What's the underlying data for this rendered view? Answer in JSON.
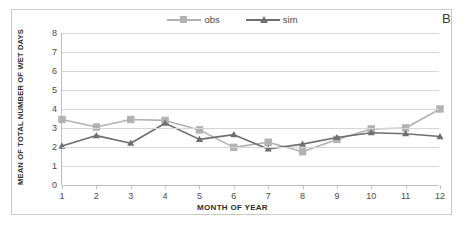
{
  "panel": {
    "letter": "B"
  },
  "legend": {
    "position": "top-center",
    "items": [
      {
        "label": "obs",
        "color": "#b2b2b2",
        "marker": "square"
      },
      {
        "label": "sim",
        "color": "#6f6f6f",
        "marker": "triangle"
      }
    ]
  },
  "chart_data": {
    "type": "line",
    "title": "",
    "xlabel": "MONTH OF YEAR",
    "ylabel": "MEAN OF TOTAL NUMBER OF WET DAYS",
    "categories": [
      "1",
      "2",
      "3",
      "4",
      "5",
      "6",
      "7",
      "8",
      "9",
      "10",
      "11",
      "12"
    ],
    "x": [
      1,
      2,
      3,
      4,
      5,
      6,
      7,
      8,
      9,
      10,
      11,
      12
    ],
    "xlim": [
      1,
      12
    ],
    "ylim": [
      0,
      8
    ],
    "yticks": [
      0,
      1,
      2,
      3,
      4,
      5,
      6,
      7,
      8
    ],
    "grid": true,
    "series": [
      {
        "name": "obs",
        "color": "#b2b2b2",
        "marker": "square",
        "values": [
          3.45,
          3.05,
          3.45,
          3.4,
          2.9,
          1.98,
          2.25,
          1.75,
          2.4,
          2.95,
          3.0,
          4.0
        ]
      },
      {
        "name": "sim",
        "color": "#6f6f6f",
        "marker": "triangle",
        "values": [
          2.05,
          2.6,
          2.2,
          3.25,
          2.4,
          2.65,
          1.9,
          2.15,
          2.5,
          2.75,
          2.7,
          2.55
        ]
      }
    ]
  }
}
